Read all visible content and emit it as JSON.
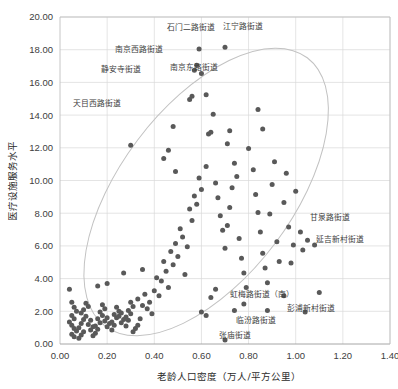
{
  "chart_data": {
    "type": "scatter",
    "title": "",
    "xlabel": "老龄人口密度（万人/平方公里）",
    "ylabel": "医疗设施服务水平",
    "xlim": [
      0.0,
      1.4
    ],
    "ylim": [
      0.0,
      20.0
    ],
    "xticks": [
      "0.00",
      "0.20",
      "0.40",
      "0.60",
      "0.80",
      "1.00",
      "1.20",
      "1.40"
    ],
    "yticks": [
      "0.00",
      "2.00",
      "4.00",
      "6.00",
      "8.00",
      "10.00",
      "12.00",
      "14.00",
      "16.00",
      "18.00",
      "20.00"
    ],
    "grid": true,
    "legend": "none",
    "point_color": "#595959",
    "envelope_color": "#c2c2c2",
    "envelope_note": "rotated ellipse confidence envelope enclosing the point cloud",
    "points": [
      [
        0.04,
        3.35
      ],
      [
        0.05,
        2.55
      ],
      [
        0.06,
        2.25
      ],
      [
        0.07,
        2.0
      ],
      [
        0.05,
        1.75
      ],
      [
        0.06,
        1.55
      ],
      [
        0.04,
        1.35
      ],
      [
        0.05,
        1.15
      ],
      [
        0.06,
        0.95
      ],
      [
        0.07,
        0.8
      ],
      [
        0.05,
        0.6
      ],
      [
        0.06,
        0.45
      ],
      [
        0.08,
        0.35
      ],
      [
        0.09,
        0.55
      ],
      [
        0.1,
        0.75
      ],
      [
        0.08,
        1.0
      ],
      [
        0.09,
        1.25
      ],
      [
        0.1,
        1.5
      ],
      [
        0.11,
        1.7
      ],
      [
        0.09,
        1.9
      ],
      [
        0.1,
        2.1
      ],
      [
        0.12,
        2.3
      ],
      [
        0.11,
        2.5
      ],
      [
        0.13,
        1.45
      ],
      [
        0.12,
        1.2
      ],
      [
        0.14,
        1.05
      ],
      [
        0.13,
        0.85
      ],
      [
        0.15,
        0.65
      ],
      [
        0.14,
        0.5
      ],
      [
        0.16,
        0.9
      ],
      [
        0.15,
        1.1
      ],
      [
        0.17,
        1.3
      ],
      [
        0.16,
        1.55
      ],
      [
        0.18,
        1.75
      ],
      [
        0.17,
        1.95
      ],
      [
        0.19,
        2.15
      ],
      [
        0.18,
        2.4
      ],
      [
        0.2,
        1.6
      ],
      [
        0.19,
        1.4
      ],
      [
        0.21,
        1.25
      ],
      [
        0.2,
        1.05
      ],
      [
        0.22,
        0.85
      ],
      [
        0.23,
        1.15
      ],
      [
        0.22,
        1.35
      ],
      [
        0.24,
        1.6
      ],
      [
        0.23,
        1.8
      ],
      [
        0.25,
        2.0
      ],
      [
        0.24,
        2.25
      ],
      [
        0.26,
        1.9
      ],
      [
        0.25,
        1.7
      ],
      [
        0.27,
        1.5
      ],
      [
        0.26,
        1.3
      ],
      [
        0.28,
        1.1
      ],
      [
        0.29,
        1.45
      ],
      [
        0.28,
        1.65
      ],
      [
        0.3,
        1.85
      ],
      [
        0.29,
        2.05
      ],
      [
        0.31,
        2.3
      ],
      [
        0.3,
        2.55
      ],
      [
        0.32,
        0.95
      ],
      [
        0.31,
        0.75
      ],
      [
        0.33,
        1.15
      ],
      [
        0.34,
        1.55
      ],
      [
        0.35,
        2.35
      ],
      [
        0.33,
        2.75
      ],
      [
        0.36,
        3.05
      ],
      [
        0.3,
        12.15
      ],
      [
        0.27,
        4.35
      ],
      [
        0.2,
        3.7
      ],
      [
        0.16,
        3.55
      ],
      [
        0.35,
        4.55
      ],
      [
        0.38,
        2.55
      ],
      [
        0.37,
        2.15
      ],
      [
        0.39,
        1.85
      ],
      [
        0.4,
        3.25
      ],
      [
        0.41,
        4.05
      ],
      [
        0.42,
        2.95
      ],
      [
        0.43,
        3.85
      ],
      [
        0.44,
        5.05
      ],
      [
        0.45,
        4.45
      ],
      [
        0.46,
        3.45
      ],
      [
        0.47,
        5.65
      ],
      [
        0.48,
        4.85
      ],
      [
        0.49,
        6.15
      ],
      [
        0.5,
        5.35
      ],
      [
        0.51,
        7.05
      ],
      [
        0.52,
        6.55
      ],
      [
        0.53,
        4.25
      ],
      [
        0.54,
        5.95
      ],
      [
        0.55,
        8.25
      ],
      [
        0.56,
        7.55
      ],
      [
        0.57,
        9.05
      ],
      [
        0.58,
        8.55
      ],
      [
        0.59,
        10.15
      ],
      [
        0.6,
        9.45
      ],
      [
        0.44,
        11.35
      ],
      [
        0.46,
        11.85
      ],
      [
        0.48,
        13.3
      ],
      [
        0.49,
        10.55
      ],
      [
        0.55,
        14.95
      ],
      [
        0.56,
        15.15
      ],
      [
        0.57,
        16.75
      ],
      [
        0.58,
        17.05
      ],
      [
        0.6,
        16.55
      ],
      [
        0.62,
        15.25
      ],
      [
        0.63,
        12.85
      ],
      [
        0.64,
        12.95
      ],
      [
        0.65,
        14.05
      ],
      [
        0.62,
        10.85
      ],
      [
        0.59,
        18.05
      ],
      [
        0.7,
        18.15
      ],
      [
        0.66,
        9.85
      ],
      [
        0.67,
        8.95
      ],
      [
        0.68,
        7.85
      ],
      [
        0.69,
        6.95
      ],
      [
        0.7,
        5.85
      ],
      [
        0.71,
        7.25
      ],
      [
        0.72,
        8.35
      ],
      [
        0.73,
        9.55
      ],
      [
        0.71,
        12.25
      ],
      [
        0.72,
        13.05
      ],
      [
        0.74,
        11.05
      ],
      [
        0.75,
        10.25
      ],
      [
        0.76,
        6.45
      ],
      [
        0.77,
        5.25
      ],
      [
        0.78,
        4.35
      ],
      [
        0.79,
        3.45
      ],
      [
        0.74,
        2.05
      ],
      [
        0.8,
        11.95
      ],
      [
        0.82,
        10.65
      ],
      [
        0.83,
        9.15
      ],
      [
        0.84,
        8.05
      ],
      [
        0.85,
        6.85
      ],
      [
        0.86,
        5.55
      ],
      [
        0.87,
        4.65
      ],
      [
        0.88,
        3.75
      ],
      [
        0.89,
        7.95
      ],
      [
        0.9,
        9.75
      ],
      [
        0.91,
        11.15
      ],
      [
        0.86,
        13.15
      ],
      [
        0.84,
        14.35
      ],
      [
        0.92,
        6.25
      ],
      [
        0.93,
        5.05
      ],
      [
        0.95,
        8.65
      ],
      [
        0.96,
        10.45
      ],
      [
        0.97,
        7.15
      ],
      [
        0.98,
        4.95
      ],
      [
        0.99,
        6.05
      ],
      [
        1.0,
        9.35
      ],
      [
        1.02,
        6.85
      ],
      [
        1.03,
        5.75
      ],
      [
        1.05,
        6.35
      ],
      [
        1.08,
        6.05
      ],
      [
        0.6,
        1.95
      ],
      [
        0.62,
        1.75
      ],
      [
        0.88,
        2.05
      ],
      [
        1.04,
        1.95
      ],
      [
        0.7,
        0.25
      ],
      [
        0.64,
        2.85
      ],
      [
        0.66,
        3.35
      ],
      [
        0.78,
        2.45
      ],
      [
        0.95,
        2.95
      ],
      [
        1.1,
        3.15
      ]
    ],
    "annotations": [
      {
        "label": "天目西路街道",
        "x": 0.3,
        "y": 12.15,
        "lx": 0.055,
        "ly": 14.55,
        "anchor": "start"
      },
      {
        "label": "静安寺街道",
        "x": 0.48,
        "y": 16.75,
        "lx": 0.175,
        "ly": 16.65,
        "anchor": "start"
      },
      {
        "label": "南京西路街道",
        "x": 0.5,
        "y": 17.3,
        "lx": 0.235,
        "ly": 17.85,
        "anchor": "start"
      },
      {
        "label": "石门二路街道",
        "x": 0.625,
        "y": 18.15,
        "lx": 0.455,
        "ly": 19.2,
        "anchor": "start"
      },
      {
        "label": "江宁路街道",
        "x": 0.775,
        "y": 18.15,
        "lx": 0.69,
        "ly": 19.25,
        "anchor": "start"
      },
      {
        "label": "南京东路街道",
        "x": 0.625,
        "y": 16.3,
        "lx": 0.465,
        "ly": 16.75,
        "anchor": "start"
      },
      {
        "label": "甘泉路街道",
        "x": 1.02,
        "y": 6.85,
        "lx": 1.06,
        "ly": 7.6,
        "anchor": "start"
      },
      {
        "label": "延吉新村街道",
        "x": 1.045,
        "y": 6.0,
        "lx": 1.085,
        "ly": 6.25,
        "anchor": "start"
      },
      {
        "label": "虹梅路街道（南）",
        "x": 0.705,
        "y": 2.05,
        "lx": 0.72,
        "ly": 2.85,
        "anchor": "start"
      },
      {
        "label": "彭浦新村街道",
        "x": 0.93,
        "y": 1.85,
        "lx": 0.965,
        "ly": 2.0,
        "anchor": "start"
      },
      {
        "label": "临汾路街道",
        "x": 0.705,
        "y": 1.7,
        "lx": 0.745,
        "ly": 1.3,
        "anchor": "start"
      },
      {
        "label": "张庙街道",
        "x": 0.64,
        "y": 0.25,
        "lx": 0.675,
        "ly": 0.35,
        "anchor": "start"
      }
    ]
  }
}
